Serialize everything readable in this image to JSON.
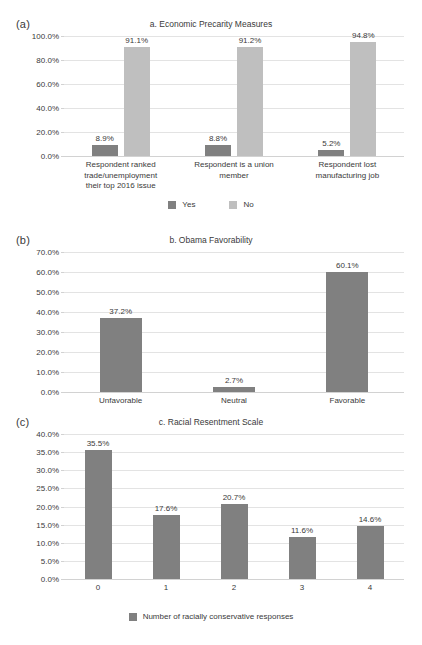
{
  "figure": {
    "width": 422,
    "height": 645,
    "background": "#ffffff",
    "colors": {
      "series_dark": "#808080",
      "series_light": "#bfbfbf",
      "gridline": "#e3e3e3",
      "axis": "#d2d2d2",
      "text": "#3a3a3a"
    }
  },
  "panels": [
    {
      "tag": "(a)",
      "title": "a. Economic Precarity Measures",
      "legend_position": "bottom-center"
    },
    {
      "tag": "(b)",
      "title": "b. Obama Favorability",
      "legend_position": "none"
    },
    {
      "tag": "(c)",
      "title": "c. Racial Resentment Scale",
      "legend_position": "bottom-center"
    }
  ],
  "chart_data": [
    {
      "type": "bar",
      "title": "a. Economic Precarity Measures",
      "panel_tag": "(a)",
      "xlabel": "",
      "ylabel": "",
      "ylim": [
        0,
        100
      ],
      "ytick_labels": [
        "0.0%",
        "20.0%",
        "40.0%",
        "60.0%",
        "80.0%",
        "100.0%"
      ],
      "ytick_values": [
        0,
        20,
        40,
        60,
        80,
        100
      ],
      "grid": true,
      "legend": [
        "Yes",
        "No"
      ],
      "legend_position": "bottom",
      "categories": [
        "Respondent ranked trade/unemployment their top 2016 issue",
        "Respondent is a union member",
        "Respondent lost manufacturing job"
      ],
      "category_lines": [
        [
          "Respondent ranked",
          "trade/unemployment",
          "their top 2016 issue"
        ],
        [
          "Respondent is a union",
          "member"
        ],
        [
          "Respondent lost",
          "manufacturing job"
        ]
      ],
      "series": [
        {
          "name": "Yes",
          "color": "#808080",
          "values": [
            8.9,
            8.8,
            5.2
          ],
          "labels": [
            "8.9%",
            "8.8%",
            "5.2%"
          ]
        },
        {
          "name": "No",
          "color": "#bfbfbf",
          "values": [
            91.1,
            91.2,
            94.8
          ],
          "labels": [
            "91.1%",
            "91.2%",
            "94.8%"
          ]
        }
      ]
    },
    {
      "type": "bar",
      "title": "b. Obama Favorability",
      "panel_tag": "(b)",
      "xlabel": "",
      "ylabel": "",
      "ylim": [
        0,
        70
      ],
      "ytick_labels": [
        "0.0%",
        "10.0%",
        "20.0%",
        "30.0%",
        "40.0%",
        "50.0%",
        "60.0%",
        "70.0%"
      ],
      "ytick_values": [
        0,
        10,
        20,
        30,
        40,
        50,
        60,
        70
      ],
      "grid": true,
      "legend": [],
      "legend_position": "none",
      "categories": [
        "Unfavorable",
        "Neutral",
        "Favorable"
      ],
      "series": [
        {
          "name": "Obama Favorability",
          "color": "#808080",
          "values": [
            37.2,
            2.7,
            60.1
          ],
          "labels": [
            "37.2%",
            "2.7%",
            "60.1%"
          ]
        }
      ]
    },
    {
      "type": "bar",
      "title": "c. Racial Resentment Scale",
      "panel_tag": "(c)",
      "xlabel": "",
      "ylabel": "",
      "ylim": [
        0,
        40
      ],
      "ytick_labels": [
        "0.0%",
        "5.0%",
        "10.0%",
        "15.0%",
        "20.0%",
        "25.0%",
        "30.0%",
        "35.0%",
        "40.0%"
      ],
      "ytick_values": [
        0,
        5,
        10,
        15,
        20,
        25,
        30,
        35,
        40
      ],
      "grid": true,
      "legend": [
        "Number of racially conservative responses"
      ],
      "legend_position": "bottom",
      "categories": [
        "0",
        "1",
        "2",
        "3",
        "4"
      ],
      "series": [
        {
          "name": "Number of racially conservative responses",
          "color": "#808080",
          "values": [
            35.5,
            17.6,
            20.7,
            11.6,
            14.6
          ],
          "labels": [
            "35.5%",
            "17.6%",
            "20.7%",
            "11.6%",
            "14.6%"
          ]
        }
      ]
    }
  ]
}
